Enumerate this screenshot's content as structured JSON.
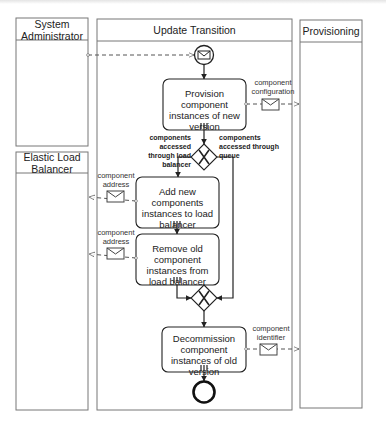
{
  "diagram": {
    "type": "BPMN collaboration",
    "pools": [
      {
        "id": "sysadmin",
        "label": "System Administrator"
      },
      {
        "id": "update",
        "label": "Update Transition"
      },
      {
        "id": "provisioning",
        "label": "Provisioning"
      },
      {
        "id": "elb",
        "label": "Elastic Load Balancer"
      }
    ],
    "tasks": [
      {
        "id": "t1",
        "label": "Provision component instances of new version",
        "marker": "multi-instance"
      },
      {
        "id": "t2",
        "label": "Add new components instances to load balancer",
        "marker": "multi-instance"
      },
      {
        "id": "t3",
        "label": "Remove old component instances from load balancer",
        "marker": "multi-instance"
      },
      {
        "id": "t4",
        "label": "Decommission component instances of old version",
        "marker": "multi-instance"
      }
    ],
    "gateways": [
      {
        "id": "g1",
        "type": "exclusive",
        "left_label": "components accessed through load balancer",
        "right_label": "components accessed through queue"
      },
      {
        "id": "g2",
        "type": "exclusive"
      }
    ],
    "events": [
      {
        "id": "start",
        "type": "message start event"
      },
      {
        "id": "end",
        "type": "end event"
      }
    ],
    "messages": [
      {
        "id": "m1",
        "label": "component configuration",
        "from": "t1",
        "to": "provisioning"
      },
      {
        "id": "m2",
        "label": "component address",
        "from": "t2",
        "to": "elb"
      },
      {
        "id": "m3",
        "label": "component address",
        "from": "t3",
        "to": "elb"
      },
      {
        "id": "m4",
        "label": "component identifier",
        "from": "t4",
        "to": "provisioning"
      },
      {
        "id": "m0",
        "label": "",
        "from": "sysadmin",
        "to": "start"
      }
    ]
  },
  "labels": {
    "sysadmin": "System Administrator",
    "update": "Update Transition",
    "provisioning": "Provisioning",
    "elb": "Elastic Load Balancer",
    "t1": "Provision component instances of new version",
    "t2": "Add new components instances to load balancer",
    "t3": "Remove old component instances from load balancer",
    "t4": "Decommission component instances of old version",
    "g1_left": "components accessed through load balancer",
    "g1_right": "components accessed through queue",
    "m1": "component configuration",
    "m2": "component address",
    "m3": "component address",
    "m4": "component identifier"
  },
  "colors": {
    "stroke": "#333333",
    "lane": "#666666",
    "background": "#ffffff"
  }
}
